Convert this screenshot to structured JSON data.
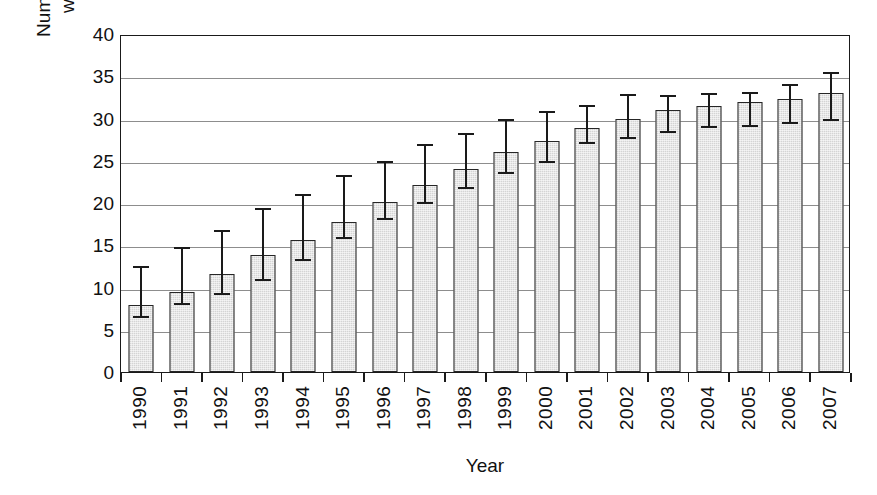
{
  "chart_data": {
    "type": "bar",
    "title": "",
    "xlabel": "Year",
    "ylabel": "Number of people living\nwith HIV (Millions)",
    "categories": [
      "1990",
      "1991",
      "1992",
      "1993",
      "1994",
      "1995",
      "1996",
      "1997",
      "1998",
      "1999",
      "2000",
      "2001",
      "2002",
      "2003",
      "2004",
      "2005",
      "2006",
      "2007"
    ],
    "values": [
      7.9,
      9.5,
      11.6,
      13.8,
      15.6,
      17.8,
      20.1,
      22.1,
      24.0,
      26.0,
      27.3,
      28.9,
      29.9,
      31.0,
      31.5,
      32.0,
      32.3,
      33.0
    ],
    "error_low": [
      6.9,
      8.4,
      9.6,
      11.3,
      13.6,
      16.2,
      18.5,
      20.3,
      22.1,
      23.9,
      25.2,
      27.4,
      28.1,
      28.8,
      29.4,
      29.5,
      29.8,
      30.2
    ],
    "error_high": [
      12.8,
      15.0,
      17.0,
      19.6,
      21.3,
      23.5,
      25.2,
      27.2,
      28.5,
      30.2,
      31.1,
      31.8,
      33.1,
      33.0,
      33.2,
      33.4,
      34.3,
      35.7
    ],
    "ylim": [
      0,
      40
    ],
    "yticks": [
      0,
      5,
      10,
      15,
      20,
      25,
      30,
      35,
      40
    ],
    "ytick_labels": [
      "0",
      "5",
      "10",
      "15",
      "20",
      "25",
      "30",
      "35",
      "40"
    ],
    "grid": true,
    "grid_axis": "y",
    "legend": "none",
    "bar_color": "#d4d4d4",
    "bar_edge_color": "#262626",
    "error_bar_color": "#1a1a1a",
    "axis_color": "#1a1a1a",
    "gridline_color": "#8d8d8d",
    "error_bar_note": "95% confidence / uncertainty range"
  }
}
